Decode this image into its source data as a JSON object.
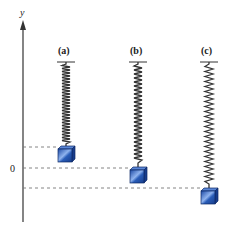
{
  "diagram": {
    "axis": {
      "label": "y",
      "origin_label": "0"
    },
    "springs": [
      {
        "id": "a",
        "label": "(a)",
        "x": 66,
        "block_top": 146
      },
      {
        "id": "b",
        "label": "(b)",
        "x": 138,
        "block_top": 167
      },
      {
        "id": "c",
        "label": "(c)",
        "x": 209,
        "block_top": 188
      }
    ],
    "reference_lines": [
      {
        "name": "rest-position-a",
        "y": 147
      },
      {
        "name": "equilibrium-zero",
        "y": 168
      },
      {
        "name": "max-extension-c",
        "y": 188
      }
    ],
    "colors": {
      "block_fill": "#2a5db8",
      "block_highlight": "#8fb3ee",
      "block_edge": "#0e2a66",
      "spring": "#333333",
      "dashed": "#777777",
      "axis": "#333333"
    }
  }
}
